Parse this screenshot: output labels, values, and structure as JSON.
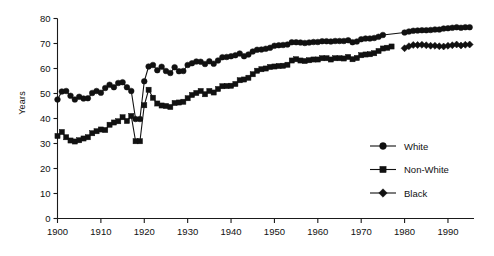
{
  "chart_data": {
    "type": "line",
    "title": "",
    "xlabel": "",
    "ylabel": "Years",
    "xlim": [
      1900,
      1996
    ],
    "ylim": [
      0,
      80
    ],
    "xticks": [
      1900,
      1910,
      1920,
      1930,
      1940,
      1950,
      1960,
      1970,
      1980,
      1990
    ],
    "yticks": [
      0,
      10,
      20,
      30,
      40,
      50,
      60,
      70,
      80
    ],
    "grid": false,
    "legend_position": "right-center",
    "series": [
      {
        "name": "White",
        "marker": "circle",
        "x": [
          1900,
          1901,
          1902,
          1903,
          1904,
          1905,
          1906,
          1907,
          1908,
          1909,
          1910,
          1911,
          1912,
          1913,
          1914,
          1915,
          1916,
          1917,
          1918,
          1919,
          1920,
          1921,
          1922,
          1923,
          1924,
          1925,
          1926,
          1927,
          1928,
          1929,
          1930,
          1931,
          1932,
          1933,
          1934,
          1935,
          1936,
          1937,
          1938,
          1939,
          1940,
          1941,
          1942,
          1943,
          1944,
          1945,
          1946,
          1947,
          1948,
          1949,
          1950,
          1951,
          1952,
          1953,
          1954,
          1955,
          1956,
          1957,
          1958,
          1959,
          1960,
          1961,
          1962,
          1963,
          1964,
          1965,
          1966,
          1967,
          1968,
          1969,
          1970,
          1971,
          1972,
          1973,
          1974,
          1975,
          1980,
          1981,
          1982,
          1983,
          1984,
          1985,
          1986,
          1987,
          1988,
          1989,
          1990,
          1991,
          1992,
          1993,
          1994,
          1995
        ],
        "y": [
          47.6,
          50.8,
          51.0,
          49.1,
          47.6,
          48.7,
          48.0,
          48.1,
          50.2,
          51.0,
          50.3,
          52.2,
          53.5,
          52.5,
          54.2,
          54.5,
          52.5,
          51.0,
          39.8,
          39.8,
          54.9,
          60.8,
          61.4,
          59.3,
          60.7,
          59.0,
          58.2,
          60.5,
          58.9,
          59.0,
          61.4,
          62.1,
          62.8,
          62.7,
          61.8,
          62.9,
          61.9,
          63.2,
          64.5,
          64.6,
          64.9,
          65.3,
          66.0,
          64.9,
          65.6,
          66.8,
          67.5,
          67.6,
          67.9,
          68.3,
          69.1,
          69.3,
          69.4,
          69.6,
          70.5,
          70.5,
          70.4,
          70.2,
          70.4,
          70.6,
          70.6,
          70.9,
          70.9,
          70.8,
          71.0,
          71.0,
          71.0,
          71.3,
          70.5,
          70.8,
          71.7,
          72.0,
          72.0,
          72.2,
          72.7,
          73.4,
          74.4,
          74.8,
          75.1,
          75.2,
          75.3,
          75.3,
          75.4,
          75.6,
          75.6,
          76.0,
          76.1,
          76.3,
          76.5,
          76.3,
          76.5,
          76.5
        ]
      },
      {
        "name": "Non-White",
        "marker": "square",
        "x": [
          1900,
          1901,
          1902,
          1903,
          1904,
          1905,
          1906,
          1907,
          1908,
          1909,
          1910,
          1911,
          1912,
          1913,
          1914,
          1915,
          1916,
          1917,
          1918,
          1919,
          1920,
          1921,
          1922,
          1923,
          1924,
          1925,
          1926,
          1927,
          1928,
          1929,
          1930,
          1931,
          1932,
          1933,
          1934,
          1935,
          1936,
          1937,
          1938,
          1939,
          1940,
          1941,
          1942,
          1943,
          1944,
          1945,
          1946,
          1947,
          1948,
          1949,
          1950,
          1951,
          1952,
          1953,
          1954,
          1955,
          1956,
          1957,
          1958,
          1959,
          1960,
          1961,
          1962,
          1963,
          1964,
          1965,
          1966,
          1967,
          1968,
          1969,
          1970,
          1971,
          1972,
          1973,
          1974,
          1975,
          1976,
          1977
        ],
        "y": [
          33.0,
          34.6,
          32.5,
          31.2,
          30.8,
          31.3,
          32.0,
          32.5,
          34.1,
          34.9,
          35.6,
          35.4,
          37.5,
          38.4,
          38.9,
          40.5,
          39.0,
          41.0,
          30.9,
          30.9,
          45.3,
          51.5,
          48.3,
          46.0,
          45.2,
          45.0,
          44.6,
          46.2,
          46.4,
          46.7,
          48.1,
          49.4,
          50.2,
          51.0,
          49.7,
          51.0,
          50.4,
          51.8,
          52.9,
          53.0,
          53.1,
          53.8,
          55.3,
          55.6,
          56.3,
          57.7,
          59.1,
          59.7,
          60.0,
          60.6,
          60.8,
          61.0,
          61.1,
          61.5,
          63.2,
          63.7,
          63.2,
          63.0,
          63.3,
          63.6,
          63.6,
          64.1,
          64.1,
          63.6,
          64.1,
          64.1,
          64.0,
          64.6,
          63.7,
          64.2,
          65.3,
          65.6,
          65.7,
          66.1,
          67.0,
          68.0,
          68.3,
          68.8
        ]
      },
      {
        "name": "Black",
        "marker": "diamond",
        "x": [
          1980,
          1981,
          1982,
          1983,
          1984,
          1985,
          1986,
          1987,
          1988,
          1989,
          1990,
          1991,
          1992,
          1993,
          1994,
          1995
        ],
        "y": [
          68.1,
          68.9,
          69.4,
          69.4,
          69.5,
          69.3,
          69.1,
          69.1,
          68.9,
          68.8,
          69.1,
          69.3,
          69.6,
          69.2,
          69.5,
          69.6
        ]
      }
    ]
  },
  "legend": {
    "items": [
      {
        "label": "White"
      },
      {
        "label": "Non-White"
      },
      {
        "label": "Black"
      }
    ]
  }
}
